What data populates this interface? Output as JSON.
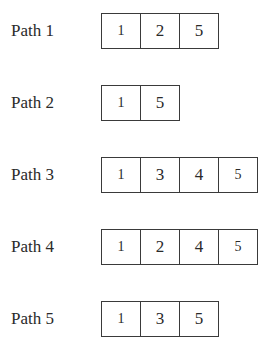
{
  "paths": [
    {
      "label": "Path 1",
      "nodes": [
        "1",
        "2",
        "5"
      ]
    },
    {
      "label": "Path 2",
      "nodes": [
        "1",
        "5"
      ]
    },
    {
      "label": "Path 3",
      "nodes": [
        "1",
        "3",
        "4",
        "5"
      ]
    },
    {
      "label": "Path 4",
      "nodes": [
        "1",
        "2",
        "4",
        "5"
      ]
    },
    {
      "label": "Path 5",
      "nodes": [
        "1",
        "3",
        "5"
      ]
    }
  ]
}
